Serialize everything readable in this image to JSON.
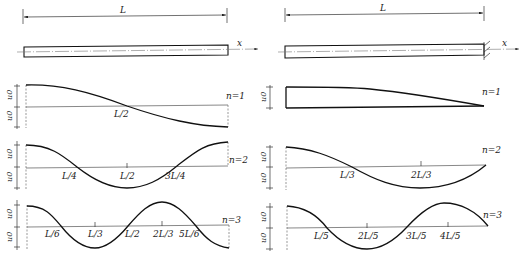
{
  "left_panel": {
    "boundary": "free-free",
    "length_label": "L",
    "axis_label": "x",
    "amplitude_label": "u0",
    "modes": [
      {
        "label": "n=1",
        "ticks": [
          "L/2"
        ]
      },
      {
        "label": "n=2",
        "ticks": [
          "L/4",
          "L/2",
          "3L/4"
        ]
      },
      {
        "label": "n=3",
        "ticks": [
          "L/6",
          "L/3",
          "L/2",
          "2L/3",
          "5L/6"
        ]
      }
    ]
  },
  "right_panel": {
    "boundary": "free-fixed",
    "length_label": "L",
    "axis_label": "x",
    "amplitude_label": "u0",
    "modes": [
      {
        "label": "n=1",
        "ticks": []
      },
      {
        "label": "n=2",
        "ticks": [
          "L/3",
          "2L/3"
        ]
      },
      {
        "label": "n=3",
        "ticks": [
          "L/5",
          "2L/5",
          "3L/5",
          "4L/5"
        ]
      }
    ]
  }
}
